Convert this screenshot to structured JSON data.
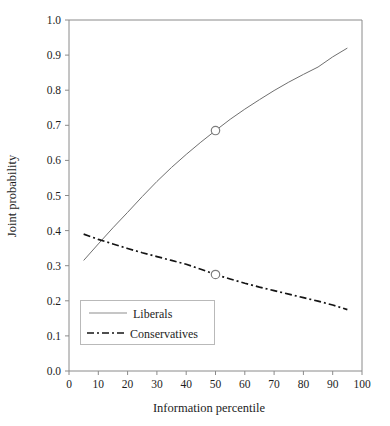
{
  "chart_data": {
    "type": "line",
    "title": "",
    "xlabel": "Information percentile",
    "ylabel": "Joint probability",
    "xlim": [
      0,
      100
    ],
    "ylim": [
      0.0,
      1.0
    ],
    "grid": false,
    "legend_position": "bottom-left",
    "x_ticks": [
      "0",
      "10",
      "20",
      "30",
      "40",
      "50",
      "60",
      "70",
      "80",
      "90",
      "100"
    ],
    "x_tick_values": [
      0,
      10,
      20,
      30,
      40,
      50,
      60,
      70,
      80,
      90,
      100
    ],
    "y_ticks": [
      "0.0",
      "0.1",
      "0.2",
      "0.3",
      "0.4",
      "0.5",
      "0.6",
      "0.7",
      "0.8",
      "0.9",
      "1.0"
    ],
    "y_tick_values": [
      0.0,
      0.1,
      0.2,
      0.3,
      0.4,
      0.5,
      0.6,
      0.7,
      0.8,
      0.9,
      1.0
    ],
    "x": [
      5,
      10,
      15,
      20,
      25,
      30,
      35,
      40,
      45,
      50,
      55,
      60,
      65,
      70,
      75,
      80,
      85,
      90,
      95
    ],
    "series": [
      {
        "name": "Liberals",
        "style": "solid",
        "color": "#6f6f6f",
        "values": [
          0.315,
          0.362,
          0.408,
          0.452,
          0.497,
          0.54,
          0.58,
          0.617,
          0.652,
          0.685,
          0.717,
          0.746,
          0.773,
          0.799,
          0.823,
          0.845,
          0.866,
          0.895,
          0.92
        ],
        "marker_point": {
          "x": 50,
          "y": 0.685
        }
      },
      {
        "name": "Conservatives",
        "style": "dash-dot",
        "color": "#141414",
        "values": [
          0.39,
          0.375,
          0.362,
          0.349,
          0.337,
          0.326,
          0.315,
          0.304,
          0.29,
          0.275,
          0.262,
          0.25,
          0.239,
          0.229,
          0.219,
          0.209,
          0.199,
          0.188,
          0.175
        ],
        "marker_point": {
          "x": 50,
          "y": 0.275
        }
      }
    ],
    "annotations": [
      {
        "name": "crossing-point",
        "x": 11,
        "y": 0.37
      }
    ]
  },
  "legend": {
    "items": [
      {
        "label": "Liberals"
      },
      {
        "label": "Conservatives"
      }
    ]
  }
}
